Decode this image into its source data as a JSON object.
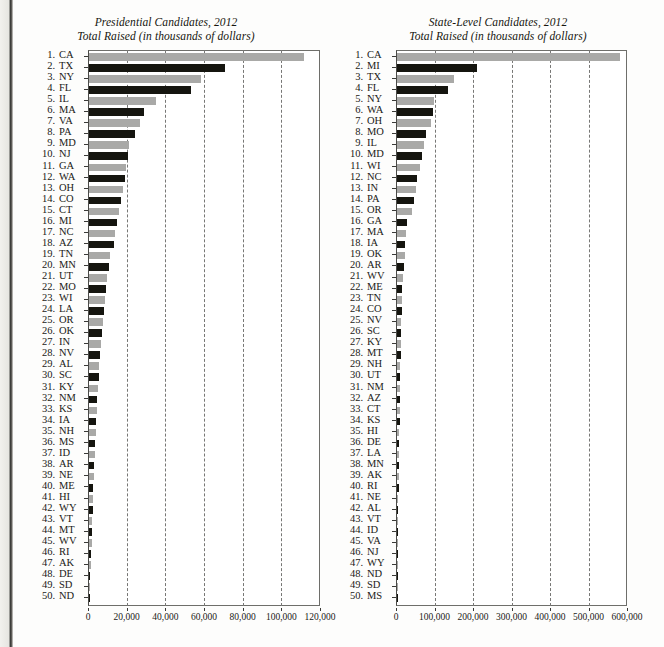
{
  "page": {
    "background_color": "#fdfdfc",
    "bar_color_odd": "#a9a9a7",
    "bar_color_even": "#15150f",
    "axis_color": "#6e6e6a"
  },
  "charts": [
    {
      "title": "Presidential Candidates, 2012",
      "subtitle": "Total Raised (in thousands of dollars)",
      "xlabel": "",
      "ylabel": "",
      "xticks": [
        "0",
        "20,000",
        "40,000",
        "60,000",
        "80,000",
        "100,000",
        "120,000"
      ],
      "chart_data": {
        "type": "bar",
        "orientation": "horizontal",
        "title": "Presidential Candidates, 2012",
        "subtitle": "Total Raised (in thousands of dollars)",
        "xlabel": "Total Raised (in thousands of dollars)",
        "ylabel": "State",
        "xlim": [
          0,
          120000
        ],
        "xticks": [
          0,
          20000,
          40000,
          60000,
          80000,
          100000,
          120000
        ],
        "grid": true,
        "legend": "none",
        "categories": [
          "CA",
          "TX",
          "NY",
          "FL",
          "IL",
          "MA",
          "VA",
          "PA",
          "MD",
          "NJ",
          "GA",
          "WA",
          "OH",
          "CO",
          "CT",
          "MI",
          "NC",
          "AZ",
          "TN",
          "MN",
          "UT",
          "MO",
          "WI",
          "LA",
          "OR",
          "OK",
          "IN",
          "NV",
          "AL",
          "SC",
          "KY",
          "NM",
          "KS",
          "IA",
          "NH",
          "MS",
          "ID",
          "AR",
          "NE",
          "ME",
          "HI",
          "WY",
          "VT",
          "MT",
          "WV",
          "RI",
          "AK",
          "DE",
          "SD",
          "ND"
        ],
        "ranks": [
          1,
          2,
          3,
          4,
          5,
          6,
          7,
          8,
          9,
          10,
          11,
          12,
          13,
          14,
          15,
          16,
          17,
          18,
          19,
          20,
          21,
          22,
          23,
          24,
          25,
          26,
          27,
          28,
          29,
          30,
          31,
          32,
          33,
          34,
          35,
          36,
          37,
          38,
          39,
          40,
          41,
          42,
          43,
          44,
          45,
          46,
          47,
          48,
          49,
          50
        ],
        "values": [
          111000,
          70500,
          58000,
          53000,
          34500,
          28500,
          26500,
          24000,
          20500,
          20000,
          19000,
          18500,
          17500,
          16500,
          15500,
          14500,
          13500,
          13000,
          11000,
          10500,
          9500,
          9000,
          8200,
          7800,
          7200,
          6800,
          6200,
          5800,
          5400,
          5000,
          4600,
          4300,
          4000,
          3700,
          3400,
          3100,
          2900,
          2700,
          2500,
          2300,
          2100,
          1900,
          1700,
          1500,
          1300,
          1100,
          900,
          700,
          500,
          300
        ]
      }
    },
    {
      "title": "State-Level Candidates, 2012",
      "subtitle": "Total Raised (in thousands of dollars)",
      "xlabel": "",
      "ylabel": "",
      "xticks": [
        "0",
        "100,000",
        "200,000",
        "300,000",
        "400,000",
        "500,000",
        "600,000"
      ],
      "chart_data": {
        "type": "bar",
        "orientation": "horizontal",
        "title": "State-Level Candidates, 2012",
        "subtitle": "Total Raised (in thousands of dollars)",
        "xlabel": "Total Raised (in thousands of dollars)",
        "ylabel": "State",
        "xlim": [
          0,
          600000
        ],
        "xticks": [
          0,
          100000,
          200000,
          300000,
          400000,
          500000,
          600000
        ],
        "grid": true,
        "legend": "none",
        "categories": [
          "CA",
          "MI",
          "TX",
          "FL",
          "NY",
          "WA",
          "OH",
          "MO",
          "IL",
          "MD",
          "WI",
          "NC",
          "IN",
          "PA",
          "OR",
          "GA",
          "MA",
          "IA",
          "OK",
          "AR",
          "WV",
          "ME",
          "TN",
          "CO",
          "NV",
          "SC",
          "KY",
          "MT",
          "NH",
          "UT",
          "NM",
          "AZ",
          "CT",
          "KS",
          "HI",
          "DE",
          "LA",
          "MN",
          "AK",
          "RI",
          "NE",
          "AL",
          "VT",
          "ID",
          "VA",
          "NJ",
          "WY",
          "ND",
          "SD",
          "MS"
        ],
        "ranks": [
          1,
          2,
          3,
          4,
          5,
          6,
          7,
          8,
          9,
          10,
          11,
          12,
          13,
          14,
          15,
          16,
          17,
          18,
          19,
          20,
          21,
          22,
          23,
          24,
          25,
          26,
          27,
          28,
          29,
          30,
          31,
          32,
          33,
          34,
          35,
          36,
          37,
          38,
          39,
          40,
          41,
          42,
          43,
          44,
          45,
          46,
          47,
          48,
          49,
          50
        ],
        "values": [
          580000,
          207000,
          147000,
          132000,
          96000,
          93000,
          88000,
          76000,
          70000,
          66000,
          60000,
          53000,
          50000,
          45000,
          40000,
          27000,
          24000,
          22000,
          20000,
          17000,
          15000,
          14000,
          13000,
          12000,
          11000,
          10500,
          10000,
          9500,
          9000,
          8500,
          8000,
          7500,
          7000,
          6500,
          6000,
          5500,
          5000,
          4700,
          4400,
          4100,
          3800,
          3500,
          3200,
          2900,
          2600,
          2300,
          2000,
          1700,
          1400,
          1100
        ]
      }
    }
  ]
}
